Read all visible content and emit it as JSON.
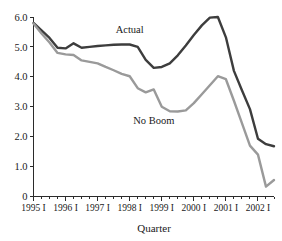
{
  "chart_data": {
    "type": "line",
    "title": "",
    "xlabel": "Quarter",
    "ylabel": "",
    "ylim": [
      0,
      6.0
    ],
    "grid": false,
    "legend_position": "inline-annotation",
    "ytick_labels": [
      "0",
      "1.0",
      "2.0",
      "3.0",
      "4.0",
      "5.0",
      "6.0"
    ],
    "ytick_values": [
      0,
      1.0,
      2.0,
      3.0,
      4.0,
      5.0,
      6.0
    ],
    "xtick_labels": [
      "1995 I",
      "1996 I",
      "1997 I",
      "1998 I",
      "1999 I",
      "2000 I",
      "2001 I",
      "2002 I"
    ],
    "minor_ticks_per_year": 4,
    "x": [
      "1995 I",
      "1995 II",
      "1995 III",
      "1995 IV",
      "1996 I",
      "1996 II",
      "1996 III",
      "1996 IV",
      "1997 I",
      "1997 II",
      "1997 III",
      "1997 IV",
      "1998 I",
      "1998 II",
      "1998 III",
      "1998 IV",
      "1999 I",
      "1999 II",
      "1999 III",
      "1999 IV",
      "2000 I",
      "2000 II",
      "2000 III",
      "2000 IV",
      "2001 I",
      "2001 II",
      "2001 III",
      "2001 IV",
      "2002 I",
      "2002 II",
      "2002 III"
    ],
    "series": [
      {
        "name": "Actual",
        "color": "#3d3d3d",
        "label_x": "1998 I",
        "label_y": 5.45,
        "values": [
          5.8,
          5.55,
          5.3,
          4.97,
          4.95,
          5.12,
          4.97,
          5.0,
          5.03,
          5.05,
          5.07,
          5.08,
          5.08,
          5.0,
          4.57,
          4.3,
          4.33,
          4.45,
          4.72,
          5.05,
          5.4,
          5.72,
          5.98,
          6.0,
          5.32,
          4.2,
          3.55,
          2.92,
          1.93,
          1.75,
          1.68
        ]
      },
      {
        "name": "No Boom",
        "color": "#9a9a9a",
        "label_x": "1998 IV",
        "label_y": 2.42,
        "values": [
          5.78,
          5.45,
          5.15,
          4.8,
          4.75,
          4.73,
          4.55,
          4.5,
          4.45,
          4.33,
          4.22,
          4.1,
          4.02,
          3.62,
          3.48,
          3.58,
          3.0,
          2.85,
          2.84,
          2.88,
          3.12,
          3.42,
          3.72,
          4.02,
          3.92,
          3.2,
          2.45,
          1.7,
          1.4,
          0.33,
          0.55
        ]
      }
    ]
  },
  "axis": {
    "x_title": "Quarter"
  }
}
